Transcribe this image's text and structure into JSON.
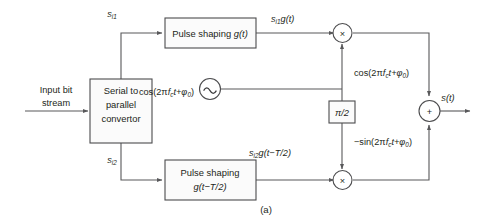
{
  "figure": {
    "caption": "(a)",
    "title_semantic": "OQPSK modulator block diagram"
  },
  "inputs": {
    "stream_line1": "Input bit",
    "stream_line2": "stream"
  },
  "blocks": {
    "serial_parallel": {
      "line1": "Serial to",
      "line2": "parallel",
      "line3": "convertor"
    },
    "pulse_shaping_i": {
      "text": "Pulse shaping ",
      "math": "g(t)"
    },
    "pulse_shaping_q": {
      "line1": "Pulse shaping",
      "math": "g(t−T/2)"
    },
    "phase_shift": {
      "label": "π/2"
    }
  },
  "signals": {
    "branch_i": {
      "base": "s",
      "sub": "i1"
    },
    "branch_q": {
      "base": "s",
      "sub": "i2"
    },
    "shaped_i": {
      "base": "s",
      "sub": "i1",
      "rest": "g(t)"
    },
    "shaped_q": {
      "base": "s",
      "sub": "i2",
      "rest": "g(t−T/2)"
    },
    "output": "s(t)"
  },
  "carriers": {
    "oscillator_label": {
      "prefix": "cos(2π",
      "fc": "f",
      "fc_sub": "c",
      "mid": "t+φ",
      "phase_sub": "0",
      "suffix": ")"
    },
    "inphase_label": {
      "prefix": "cos(2π",
      "fc": "f",
      "fc_sub": "c",
      "mid": "t+φ",
      "phase_sub": "0",
      "suffix": ")"
    },
    "quadrature_label": {
      "prefix": "−sin(2π",
      "fc": "f",
      "fc_sub": "c",
      "mid": "t+φ",
      "phase_sub": "0",
      "suffix": ")"
    }
  },
  "operators": {
    "multiplier_i": "×",
    "multiplier_q": "×",
    "summer": "+",
    "oscillator": "~"
  },
  "colors": {
    "background": "#ffffff",
    "wire": "#58585a",
    "block_stroke": "#4c4c4e",
    "block_fill": "#fbfbfb",
    "text": "#231f20"
  }
}
